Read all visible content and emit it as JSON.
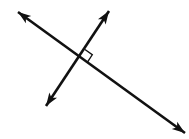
{
  "figure": {
    "background_color": "#ffffff",
    "stroke_color": "#111111",
    "width": 189,
    "height": 139,
    "caption": ""
  },
  "geometry": {
    "type": "line-diagram",
    "intersection": {
      "x": 80,
      "y": 57
    },
    "lines": [
      {
        "name": "line-falling",
        "description": "Long double-headed line running from upper-left down to lower-right",
        "x1": 18,
        "y1": 12,
        "x2": 185,
        "y2": 133,
        "stroke_width": 2.6,
        "arrow_start": true,
        "arrow_end": true
      },
      {
        "name": "line-rising",
        "description": "Shorter double-headed line running from lower-left up to upper-right",
        "x1": 46,
        "y1": 106,
        "x2": 109,
        "y2": 11,
        "stroke_width": 2.6,
        "arrow_start": true,
        "arrow_end": true
      }
    ],
    "angle_markers": [
      {
        "name": "right-angle-marker",
        "symbol": "right-angle",
        "measure_degrees": 90,
        "quadrant": "upper-right",
        "size": 9,
        "stroke_width": 1.4,
        "points": "80,50 88,54 84,62"
      }
    ],
    "arrowheads": [
      {
        "name": "arrowhead-upper-left",
        "tip_x": 18,
        "tip_y": 12
      },
      {
        "name": "arrowhead-upper-right",
        "tip_x": 109,
        "tip_y": 11
      },
      {
        "name": "arrowhead-lower-left",
        "tip_x": 46,
        "tip_y": 106
      },
      {
        "name": "arrowhead-lower-right",
        "tip_x": 185,
        "tip_y": 133
      }
    ]
  }
}
